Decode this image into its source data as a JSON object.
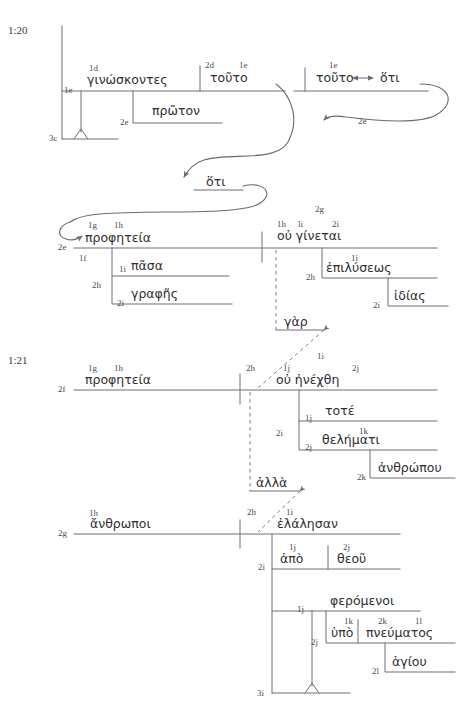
{
  "document": {
    "title": "2 Peter 1:20-21 Greek Syntactical Line Diagram",
    "verse_refs": [
      {
        "id": "ref-1-20",
        "text": "1:20",
        "x": 8,
        "y": 34
      },
      {
        "id": "ref-1-21",
        "text": "1:21",
        "x": 8,
        "y": 364
      }
    ]
  },
  "greek_words": [
    {
      "id": "w-ginoskontes",
      "text": "γινώσκοντες",
      "x": 87,
      "y": 84
    },
    {
      "id": "w-touto-1",
      "text": "τοῦτο",
      "x": 210,
      "y": 82
    },
    {
      "id": "w-proton",
      "text": "πρῶτον",
      "x": 152,
      "y": 114
    },
    {
      "id": "w-touto-2",
      "text": "τοῦτο",
      "x": 318,
      "y": 82
    },
    {
      "id": "w-hoti-1",
      "text": "ὅτι",
      "x": 379,
      "y": 82
    },
    {
      "id": "w-hoti-2",
      "text": "ὅτι",
      "x": 208,
      "y": 185
    },
    {
      "id": "w-propheteia-1",
      "text": "προφητεία",
      "x": 85,
      "y": 241
    },
    {
      "id": "w-pasa",
      "text": "πᾶσα",
      "x": 130,
      "y": 268
    },
    {
      "id": "w-graphes",
      "text": "γραφῆς",
      "x": 130,
      "y": 296
    },
    {
      "id": "w-ou-ginetai",
      "text": "οὐ γίνεται",
      "x": 278,
      "y": 238
    },
    {
      "id": "w-epilyseos",
      "text": "ἐπιλύσεως",
      "x": 325,
      "y": 270
    },
    {
      "id": "w-idias",
      "text": "ἰδίας",
      "x": 375,
      "y": 298
    },
    {
      "id": "w-gar",
      "text": "γὰρ",
      "x": 258,
      "y": 320
    },
    {
      "id": "w-propheteia-2",
      "text": "προφητεία",
      "x": 85,
      "y": 383
    },
    {
      "id": "w-ou-enechthe",
      "text": "οὐ ἠνέχθη",
      "x": 279,
      "y": 382
    },
    {
      "id": "w-tote",
      "text": "τοτέ",
      "x": 325,
      "y": 412
    },
    {
      "id": "w-thelemati",
      "text": "θελήματι",
      "x": 325,
      "y": 441
    },
    {
      "id": "w-anthropou",
      "text": "ἀνθρώπου",
      "x": 376,
      "y": 470
    },
    {
      "id": "w-alla",
      "text": "ἀλλὰ",
      "x": 249,
      "y": 481
    },
    {
      "id": "w-anthropoi",
      "text": "ἄνθρωποι",
      "x": 89,
      "y": 527
    },
    {
      "id": "w-elalesan",
      "text": "ἐλάλησαν",
      "x": 279,
      "y": 526
    },
    {
      "id": "w-apo",
      "text": "ἀπὸ",
      "x": 280,
      "y": 560
    },
    {
      "id": "w-theou",
      "text": "θεοῦ",
      "x": 337,
      "y": 560
    },
    {
      "id": "w-pheromenoi",
      "text": "φερόμενοι",
      "x": 328,
      "y": 603
    },
    {
      "id": "w-hypo",
      "text": "ὑπὸ",
      "x": 333,
      "y": 634
    },
    {
      "id": "w-pneumatos",
      "text": "πνεύματος",
      "x": 366,
      "y": 634
    },
    {
      "id": "w-hagiou",
      "text": "ἁγίου",
      "x": 389,
      "y": 663
    }
  ],
  "level_labels": [
    {
      "id": "lbl-1d",
      "text": "1d",
      "x": 89,
      "y": 71
    },
    {
      "id": "lbl-2d",
      "text": "2d",
      "x": 208,
      "y": 68
    },
    {
      "id": "lbl-1e-a",
      "text": "1e",
      "x": 240,
      "y": 68
    },
    {
      "id": "lbl-1e-left",
      "text": "1e",
      "x": 65,
      "y": 92
    },
    {
      "id": "lbl-2e-proton",
      "text": "2e",
      "x": 118,
      "y": 122
    },
    {
      "id": "lbl-3c",
      "text": "3c",
      "x": 51,
      "y": 139
    },
    {
      "id": "lbl-1e-right",
      "text": "1e",
      "x": 328,
      "y": 68
    },
    {
      "id": "lbl-2e-arrow",
      "text": "2e",
      "x": 356,
      "y": 122
    },
    {
      "id": "lbl-1g-1",
      "text": "1g",
      "x": 88,
      "y": 227
    },
    {
      "id": "lbl-1h-1",
      "text": "1h",
      "x": 115,
      "y": 227
    },
    {
      "id": "lbl-2e-proph",
      "text": "2e",
      "x": 58,
      "y": 248
    },
    {
      "id": "lbl-1f",
      "text": "1f",
      "x": 80,
      "y": 258
    },
    {
      "id": "lbl-2h-pasa",
      "text": "2h",
      "x": 106,
      "y": 285
    },
    {
      "id": "lbl-1i-pasa",
      "text": "1i",
      "x": 122,
      "y": 275
    },
    {
      "id": "lbl-2i-graphes",
      "text": "2i",
      "x": 122,
      "y": 303
    },
    {
      "id": "lbl-2g",
      "text": "2g",
      "x": 318,
      "y": 212
    },
    {
      "id": "lbl-1h-2",
      "text": "1h",
      "x": 279,
      "y": 225
    },
    {
      "id": "lbl-li",
      "text": "li",
      "x": 302,
      "y": 225
    },
    {
      "id": "lbl-2i-gin",
      "text": "2i",
      "x": 335,
      "y": 225
    },
    {
      "id": "lbl-1i-epi",
      "text": "1i",
      "x": 348,
      "y": 258
    },
    {
      "id": "lbl-2h-epi",
      "text": "2h",
      "x": 305,
      "y": 277
    },
    {
      "id": "lbl-2i-idias",
      "text": "2i",
      "x": 358,
      "y": 305
    },
    {
      "id": "lbl-1g-2",
      "text": "1g",
      "x": 88,
      "y": 369
    },
    {
      "id": "lbl-1h-3",
      "text": "1h",
      "x": 115,
      "y": 369
    },
    {
      "id": "lbl-2f",
      "text": "2f",
      "x": 58,
      "y": 390
    },
    {
      "id": "lbl-2h-en",
      "text": "2h",
      "x": 250,
      "y": 369
    },
    {
      "id": "lbl-1j-en",
      "text": "1j",
      "x": 281,
      "y": 369
    },
    {
      "id": "lbl-1i-en",
      "text": "1i",
      "x": 318,
      "y": 357
    },
    {
      "id": "lbl-2j-en",
      "text": "2j",
      "x": 349,
      "y": 369
    },
    {
      "id": "lbl-1j-tote",
      "text": "1j",
      "x": 304,
      "y": 419
    },
    {
      "id": "lbl-2i-mid",
      "text": "2i",
      "x": 276,
      "y": 433
    },
    {
      "id": "lbl-1k-thel",
      "text": "1k",
      "x": 355,
      "y": 432
    },
    {
      "id": "lbl-2j-thel",
      "text": "2j",
      "x": 304,
      "y": 448
    },
    {
      "id": "lbl-2k-anthr",
      "text": "2k",
      "x": 355,
      "y": 477
    },
    {
      "id": "lbl-2h-alla",
      "text": "2h",
      "x": 250,
      "y": 513
    },
    {
      "id": "lbl-1i-elal",
      "text": "1i",
      "x": 284,
      "y": 513
    },
    {
      "id": "lbl-1h-anthropoi",
      "text": "1h",
      "x": 90,
      "y": 514
    },
    {
      "id": "lbl-2g-anthropoi",
      "text": "2g",
      "x": 58,
      "y": 534
    },
    {
      "id": "lbl-2i-apo",
      "text": "2i",
      "x": 260,
      "y": 567
    },
    {
      "id": "lbl-1j-apo",
      "text": "1j",
      "x": 288,
      "y": 548
    },
    {
      "id": "lbl-2j-theou",
      "text": "2j",
      "x": 340,
      "y": 548
    },
    {
      "id": "lbl-1j-pher",
      "text": "1j",
      "x": 297,
      "y": 610
    },
    {
      "id": "lbl-1k-hypo",
      "text": "1k",
      "x": 343,
      "y": 621
    },
    {
      "id": "lbl-2k-pneu",
      "text": "2k",
      "x": 375,
      "y": 621
    },
    {
      "id": "lbl-1l-pneu",
      "text": "1l",
      "x": 411,
      "y": 621
    },
    {
      "id": "lbl-2j-hypo",
      "text": "2j",
      "x": 320,
      "y": 641
    },
    {
      "id": "lbl-2l-hagiou",
      "text": "2l",
      "x": 376,
      "y": 670
    },
    {
      "id": "lbl-3i",
      "text": "3i",
      "x": 259,
      "y": 694
    }
  ],
  "connectors": {
    "double_arrow_symbol": "↔",
    "arrow_note": "curved arrows link τοῦτο to ὅτι and back to προφητεία"
  },
  "colors": {
    "ink": "#2e2e32",
    "rule": "#6f6f76",
    "label": "#4a4a4a",
    "background": "#ffffff"
  }
}
